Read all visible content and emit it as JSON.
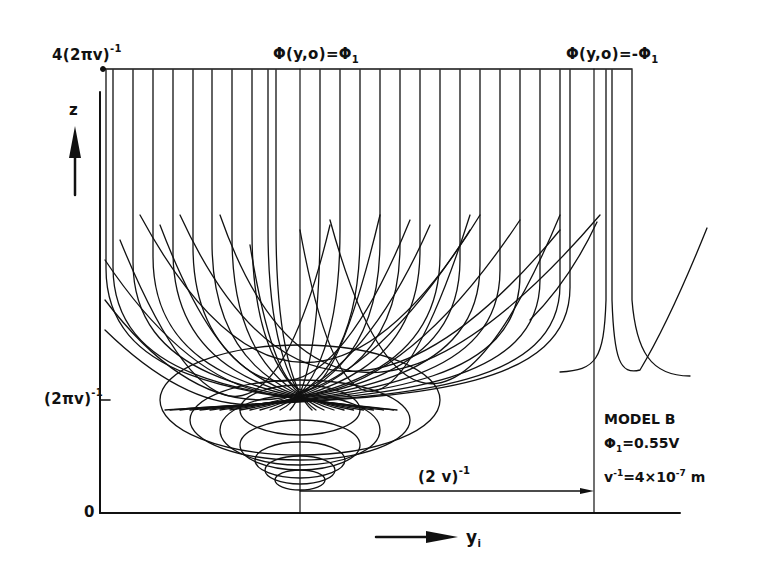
{
  "figure": {
    "type": "trajectory-diagram",
    "model_label": "MODEL B",
    "params": {
      "phi1_symbol": "Φ",
      "phi1_sub": "1",
      "phi1_value": "=0.55V",
      "v_inv_base": "v",
      "v_inv_exp": "-1",
      "v_inv_value_pre": "=4×10",
      "v_inv_value_exp": "-7",
      "v_inv_unit": " m"
    }
  },
  "axes": {
    "y_axis_label": "z",
    "x_axis_label_base": "y",
    "x_axis_label_sub": "i",
    "y_ticks": [
      {
        "base": "4(2πv)",
        "exp": "-1"
      },
      {
        "base": "(2πv)",
        "exp": "-1"
      },
      {
        "base": "0",
        "exp": ""
      }
    ]
  },
  "annotations": {
    "top_left_boundary": {
      "base": "Φ(y,o)=Φ",
      "sub": "1"
    },
    "top_right_boundary": {
      "base": "Φ(y,o)=-Φ",
      "sub": "1"
    },
    "span_label": {
      "base": "(2 v)",
      "exp": "-1"
    }
  },
  "colors": {
    "ink": "#111111",
    "background": "#ffffff"
  },
  "chart_data": {
    "type": "line",
    "title": "",
    "xlabel": "y_i",
    "ylabel": "z",
    "y_ticks": [
      "0",
      "(2πv)^-1",
      "4(2πv)^-1"
    ],
    "annotations": [
      "Φ(y,o)=Φ1",
      "Φ(y,o)=-Φ1",
      "(2v)^-1",
      "MODEL B",
      "Φ1=0.55V",
      "v^-1=4×10^-7 m"
    ],
    "grid": false
  }
}
